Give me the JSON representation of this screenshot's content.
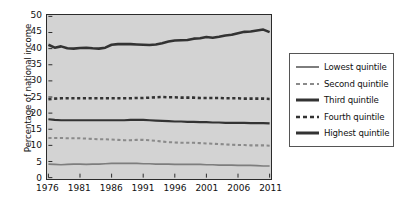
{
  "chart_data": {
    "type": "line",
    "title": "",
    "xlabel": "",
    "ylabel": "Percentage of national income",
    "xlim": [
      1976,
      2011
    ],
    "ylim": [
      0,
      50
    ],
    "grid": false,
    "legend_position": "right",
    "background": "#d3d3d3",
    "xticks": [
      1976,
      1981,
      1986,
      1991,
      1996,
      2001,
      2006,
      2011
    ],
    "yticks": [
      0,
      5,
      10,
      15,
      20,
      25,
      30,
      35,
      40,
      45,
      50
    ],
    "x": [
      1976,
      1977,
      1978,
      1979,
      1980,
      1981,
      1982,
      1983,
      1984,
      1985,
      1986,
      1987,
      1988,
      1989,
      1990,
      1991,
      1992,
      1993,
      1994,
      1995,
      1996,
      1997,
      1998,
      1999,
      2000,
      2001,
      2002,
      2003,
      2004,
      2005,
      2006,
      2007,
      2008,
      2009,
      2010,
      2011
    ],
    "series": [
      {
        "name": "Lowest quintile",
        "style": "solid",
        "color": "#7d7d7d",
        "width": 1.7,
        "values": [
          4.2,
          4.1,
          4.0,
          4.1,
          4.2,
          4.2,
          4.1,
          4.2,
          4.2,
          4.3,
          4.4,
          4.4,
          4.4,
          4.4,
          4.4,
          4.3,
          4.3,
          4.2,
          4.2,
          4.2,
          4.1,
          4.1,
          4.1,
          4.1,
          4.1,
          4.0,
          4.0,
          3.9,
          3.9,
          3.9,
          3.8,
          3.8,
          3.8,
          3.7,
          3.6,
          3.6
        ]
      },
      {
        "name": "Second quintile",
        "style": "dashed",
        "color": "#8a8a8a",
        "width": 2.1,
        "values": [
          12.3,
          12.3,
          12.3,
          12.2,
          12.2,
          12.2,
          12.1,
          12.0,
          11.9,
          11.9,
          11.8,
          11.7,
          11.6,
          11.6,
          11.7,
          11.7,
          11.6,
          11.4,
          11.2,
          11.0,
          10.9,
          10.8,
          10.8,
          10.8,
          10.7,
          10.6,
          10.5,
          10.4,
          10.3,
          10.2,
          10.1,
          10.1,
          10.0,
          10.0,
          10.0,
          9.9
        ]
      },
      {
        "name": "Third quintile",
        "style": "solid",
        "color": "#333333",
        "width": 2.2,
        "values": [
          18.1,
          17.9,
          17.8,
          17.8,
          17.8,
          17.8,
          17.8,
          17.8,
          17.8,
          17.8,
          17.8,
          17.8,
          17.8,
          17.9,
          17.9,
          17.9,
          17.8,
          17.7,
          17.6,
          17.5,
          17.4,
          17.4,
          17.3,
          17.3,
          17.2,
          17.2,
          17.1,
          17.1,
          17.0,
          17.0,
          17.0,
          17.0,
          16.9,
          16.9,
          16.9,
          16.8
        ]
      },
      {
        "name": "Fourth quintile",
        "style": "dashed",
        "color": "#333333",
        "width": 2.6,
        "values": [
          24.3,
          24.5,
          24.6,
          24.6,
          24.6,
          24.6,
          24.6,
          24.6,
          24.6,
          24.6,
          24.6,
          24.6,
          24.6,
          24.6,
          24.7,
          24.7,
          24.8,
          24.9,
          25.0,
          24.9,
          24.9,
          24.8,
          24.8,
          24.8,
          24.7,
          24.7,
          24.7,
          24.7,
          24.6,
          24.6,
          24.6,
          24.5,
          24.5,
          24.5,
          24.5,
          24.4
        ]
      },
      {
        "name": "Highest quintile",
        "style": "solid",
        "color": "#333333",
        "width": 2.6,
        "values": [
          41.2,
          40.3,
          40.7,
          40.1,
          40.0,
          40.2,
          40.3,
          40.1,
          40.0,
          40.3,
          41.2,
          41.4,
          41.4,
          41.4,
          41.3,
          41.2,
          41.1,
          41.3,
          41.7,
          42.2,
          42.5,
          42.6,
          42.7,
          43.1,
          43.2,
          43.6,
          43.4,
          43.7,
          44.1,
          44.3,
          44.8,
          45.2,
          45.3,
          45.6,
          45.9,
          45.1
        ]
      }
    ]
  },
  "legend": {
    "items": [
      {
        "label": "Lowest quintile",
        "style": "solid",
        "color": "#7d7d7d",
        "width": 2.0
      },
      {
        "label": "Second quintile",
        "style": "dashed",
        "color": "#8a8a8a",
        "width": 2.2
      },
      {
        "label": "Third quintile",
        "style": "solid",
        "color": "#333333",
        "width": 3.0
      },
      {
        "label": "Fourth quintile",
        "style": "dashed",
        "color": "#333333",
        "width": 2.6
      },
      {
        "label": "Highest quintile",
        "style": "solid",
        "color": "#333333",
        "width": 3.0
      }
    ]
  }
}
